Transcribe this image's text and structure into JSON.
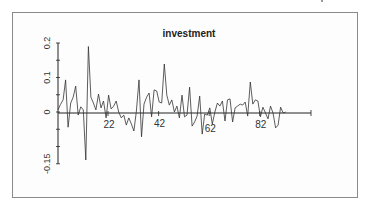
{
  "chart_data": {
    "type": "line",
    "title": "investment",
    "xlabel": "",
    "ylabel": "",
    "grid": false,
    "legend": null,
    "xlim": [
      1,
      101
    ],
    "ylim": [
      -0.15,
      0.2
    ],
    "x_ticks": [
      22,
      42,
      62,
      82
    ],
    "x_tick_labels": [
      "22",
      "42",
      "62",
      "82"
    ],
    "y_ticks": [
      -0.15,
      -0.1,
      -0.05,
      0,
      0.05,
      0.1,
      0.15,
      0.2
    ],
    "y_tick_labels": [
      "-0.15",
      "0",
      "0.1",
      "0.2"
    ],
    "y_tick_labels_at": [
      -0.15,
      0,
      0.1,
      0.2
    ],
    "series": [
      {
        "name": "investment",
        "color": "#333333",
        "x": [
          1,
          2,
          3,
          4,
          5,
          6,
          7,
          8,
          9,
          10,
          11,
          12,
          13,
          14,
          15,
          16,
          17,
          18,
          19,
          20,
          21,
          22,
          23,
          24,
          25,
          26,
          27,
          28,
          29,
          30,
          31,
          32,
          33,
          34,
          35,
          36,
          37,
          38,
          39,
          40,
          41,
          42,
          43,
          44,
          45,
          46,
          47,
          48,
          49,
          50,
          51,
          52,
          53,
          54,
          55,
          56,
          57,
          58,
          59,
          60,
          61,
          62,
          63,
          64,
          65,
          66,
          67,
          68,
          69,
          70,
          71,
          72,
          73,
          74,
          75,
          76,
          77,
          78,
          79,
          80,
          81,
          82,
          83,
          84,
          85,
          86,
          87,
          88,
          89,
          90,
          91
        ],
        "values": [
          0.006,
          0.022,
          0.035,
          0.093,
          -0.044,
          0.026,
          0.043,
          0.075,
          -0.009,
          0.015,
          0.006,
          -0.139,
          0.19,
          0.043,
          0.026,
          0.006,
          0.052,
          0.012,
          0.032,
          -0.017,
          0.049,
          0.009,
          0.017,
          0.032,
          0.0,
          -0.017,
          -0.009,
          -0.038,
          -0.017,
          -0.035,
          -0.055,
          0.003,
          0.093,
          -0.072,
          0.023,
          0.043,
          0.055,
          -0.014,
          0.064,
          0.061,
          0.029,
          0.026,
          0.139,
          0.049,
          0.02,
          0.035,
          0.0,
          0.017,
          -0.017,
          0.049,
          -0.014,
          -0.009,
          0.072,
          -0.041,
          -0.029,
          -0.012,
          0.046,
          -0.064,
          -0.006,
          -0.009,
          0.012,
          -0.035,
          0.0,
          0.026,
          0.017,
          0.032,
          -0.026,
          0.035,
          0.038,
          -0.029,
          0.012,
          0.017,
          0.023,
          0.02,
          0.029,
          -0.012,
          0.087,
          0.023,
          0.035,
          0.032,
          -0.014,
          0.014,
          -0.003,
          -0.02,
          0.017,
          -0.003,
          -0.046,
          -0.038,
          0.014,
          -0.003,
          0.0
        ]
      }
    ]
  }
}
